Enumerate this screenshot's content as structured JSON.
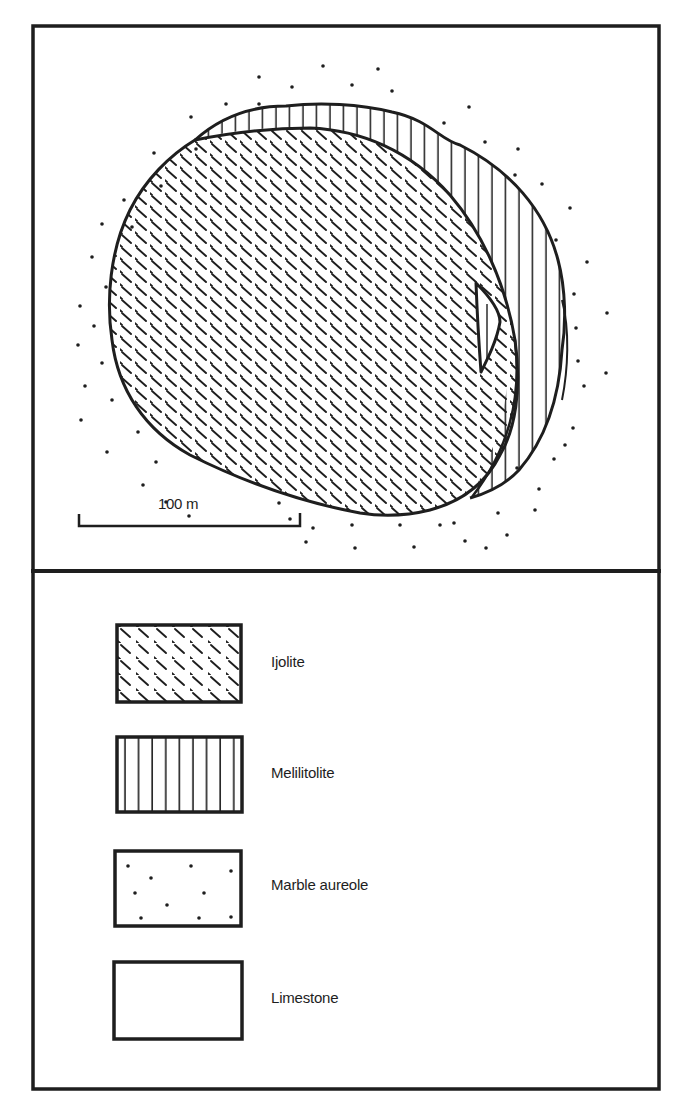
{
  "figure": {
    "type": "geological-map",
    "frame_color": "#1e1e1e",
    "background_color": "#ffffff"
  },
  "map": {
    "scale_bar": {
      "label": "100 m"
    },
    "units_shown": [
      "Ijolite",
      "Melilitolite",
      "Marble aureole",
      "Limestone"
    ],
    "features": [
      {
        "name": "ijolite-body",
        "unit": "Ijolite",
        "pattern": "dashed-diagonal"
      },
      {
        "name": "melilitolite-crescent",
        "unit": "Melilitolite",
        "pattern": "vertical-lines"
      },
      {
        "name": "marble-aureole",
        "unit": "Marble aureole",
        "pattern": "dots"
      },
      {
        "name": "melilitolite-inclusion",
        "unit": "Melilitolite",
        "pattern": "vertical-lines"
      }
    ]
  },
  "legend": {
    "items": [
      {
        "label": "Ijolite",
        "pattern": "dashed-diagonal"
      },
      {
        "label": "Melilitolite",
        "pattern": "vertical-lines"
      },
      {
        "label": "Marble aureole",
        "pattern": "dots"
      },
      {
        "label": "Limestone",
        "pattern": "blank"
      }
    ]
  }
}
